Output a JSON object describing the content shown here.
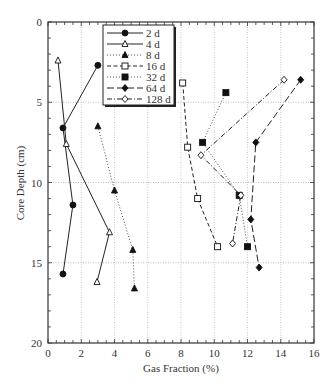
{
  "chart_data": {
    "type": "line",
    "title": "",
    "xlabel": "Gas Fraction (%)",
    "ylabel": "Core Depth (cm)",
    "xlim": [
      0,
      16
    ],
    "ylim": [
      20,
      0
    ],
    "y_inverted": true,
    "x_ticks": [
      "0",
      "2",
      "4",
      "6",
      "8",
      "10",
      "12",
      "14",
      "16"
    ],
    "y_ticks": [
      "0",
      "5",
      "10",
      "15",
      "20"
    ],
    "grid": true,
    "legend_position": "upper-left-inside",
    "series": [
      {
        "name": "2 d",
        "style": "solid",
        "marker": "filled-circle",
        "points": [
          [
            3.0,
            2.7
          ],
          [
            0.9,
            6.6
          ],
          [
            1.5,
            11.4
          ],
          [
            0.9,
            15.7
          ]
        ]
      },
      {
        "name": "4 d",
        "style": "solid",
        "marker": "open-triangle",
        "points": [
          [
            0.6,
            2.4
          ],
          [
            1.1,
            7.6
          ],
          [
            3.7,
            13.1
          ],
          [
            2.95,
            16.2
          ]
        ]
      },
      {
        "name": "8 d",
        "style": "dotted",
        "marker": "filled-triangle",
        "points": [
          [
            3.0,
            6.5
          ],
          [
            4.0,
            10.5
          ],
          [
            5.1,
            14.2
          ],
          [
            5.2,
            16.6
          ]
        ]
      },
      {
        "name": "16 d",
        "style": "dashed",
        "marker": "open-square",
        "points": [
          [
            8.1,
            3.8
          ],
          [
            8.4,
            7.8
          ],
          [
            9.0,
            11.0
          ],
          [
            10.2,
            14.0
          ]
        ]
      },
      {
        "name": "32 d",
        "style": "dotted",
        "marker": "filled-square",
        "points": [
          [
            10.7,
            4.4
          ],
          [
            9.3,
            7.5
          ],
          [
            11.5,
            10.8
          ],
          [
            12.0,
            14.0
          ]
        ]
      },
      {
        "name": "64 d",
        "style": "longdash",
        "marker": "filled-diamond",
        "points": [
          [
            15.2,
            3.6
          ],
          [
            12.5,
            7.5
          ],
          [
            12.2,
            12.3
          ],
          [
            12.7,
            15.3
          ]
        ]
      },
      {
        "name": "128 d",
        "style": "dashdot",
        "marker": "open-diamond",
        "points": [
          [
            14.2,
            3.6
          ],
          [
            9.2,
            8.3
          ],
          [
            11.6,
            10.8
          ],
          [
            11.1,
            13.8
          ]
        ]
      }
    ]
  },
  "legend": {
    "items": [
      "2 d",
      "4 d",
      "8 d",
      "16 d",
      "32 d",
      "64 d",
      "128 d"
    ]
  }
}
